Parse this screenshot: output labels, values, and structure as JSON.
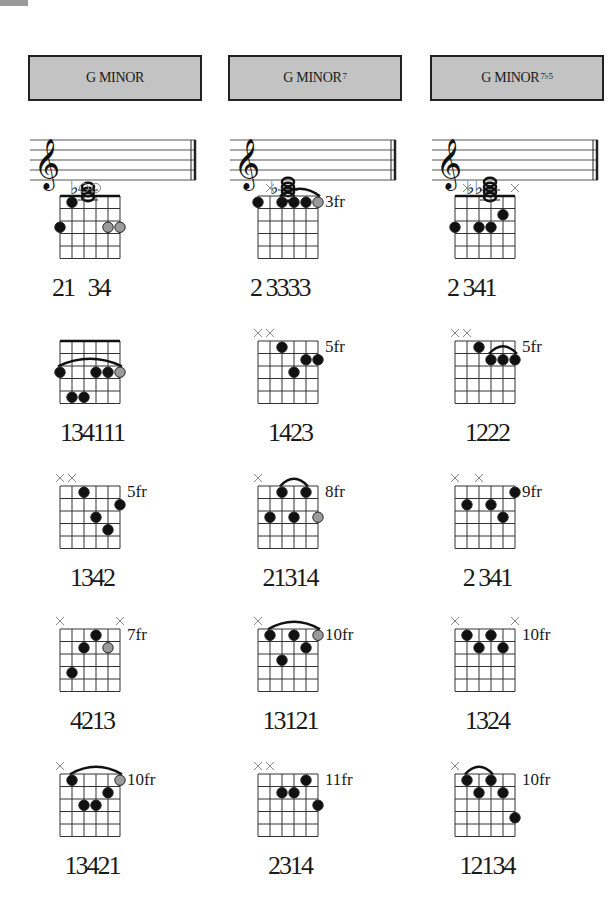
{
  "page": {
    "corner_tab_color": "#9a9a9a",
    "header_bg": "#c3c3c3"
  },
  "columns": [
    {
      "title": "G MINOR",
      "superscript": "",
      "staff": {
        "accidentals": "♭",
        "notes": 3
      },
      "diagrams": [
        {
          "markers": [
            "",
            "",
            "o",
            "o",
            "",
            ""
          ],
          "fret_label": "",
          "nut": true,
          "barre": null,
          "dots": [
            {
              "s": 0,
              "f": 3,
              "c": "b"
            },
            {
              "s": 1,
              "f": 1,
              "c": "b"
            },
            {
              "s": 4,
              "f": 3,
              "c": "g"
            },
            {
              "s": 5,
              "f": 3,
              "c": "g"
            }
          ],
          "fingering": "21   34"
        },
        {
          "markers": [
            "",
            "",
            "",
            "",
            "",
            ""
          ],
          "fret_label": "",
          "nut": true,
          "barre": {
            "from": 0,
            "to": 5,
            "f": 3
          },
          "dots": [
            {
              "s": 0,
              "f": 3,
              "c": "b"
            },
            {
              "s": 1,
              "f": 5,
              "c": "b"
            },
            {
              "s": 2,
              "f": 5,
              "c": "b"
            },
            {
              "s": 3,
              "f": 3,
              "c": "b"
            },
            {
              "s": 4,
              "f": 3,
              "c": "b"
            },
            {
              "s": 5,
              "f": 3,
              "c": "g"
            }
          ],
          "fingering": "134111"
        },
        {
          "markers": [
            "x",
            "x",
            "",
            "",
            "",
            ""
          ],
          "fret_label": "5fr",
          "nut": false,
          "barre": null,
          "dots": [
            {
              "s": 2,
              "f": 1,
              "c": "b"
            },
            {
              "s": 3,
              "f": 3,
              "c": "b"
            },
            {
              "s": 4,
              "f": 4,
              "c": "b"
            },
            {
              "s": 5,
              "f": 2,
              "c": "b"
            }
          ],
          "fingering": "1342"
        },
        {
          "markers": [
            "x",
            "",
            "",
            "",
            "",
            "x"
          ],
          "fret_label": "7fr",
          "nut": false,
          "barre": null,
          "dots": [
            {
              "s": 1,
              "f": 4,
              "c": "b"
            },
            {
              "s": 2,
              "f": 2,
              "c": "b"
            },
            {
              "s": 3,
              "f": 1,
              "c": "b"
            },
            {
              "s": 4,
              "f": 2,
              "c": "g"
            }
          ],
          "fingering": "4213"
        },
        {
          "markers": [
            "x",
            "",
            "",
            "",
            "",
            ""
          ],
          "fret_label": "10fr",
          "nut": false,
          "barre": {
            "from": 1,
            "to": 5,
            "f": 1
          },
          "dots": [
            {
              "s": 1,
              "f": 1,
              "c": "b"
            },
            {
              "s": 2,
              "f": 3,
              "c": "b"
            },
            {
              "s": 3,
              "f": 3,
              "c": "b"
            },
            {
              "s": 4,
              "f": 2,
              "c": "b"
            },
            {
              "s": 5,
              "f": 1,
              "c": "g"
            }
          ],
          "fingering": "13421"
        }
      ]
    },
    {
      "title": "G MINOR",
      "superscript": "7",
      "staff": {
        "accidentals": "♭",
        "notes": 4
      },
      "diagrams": [
        {
          "markers": [
            "",
            "x",
            "",
            "",
            "",
            ""
          ],
          "fret_label": "3fr",
          "nut": false,
          "barre": {
            "from": 2,
            "to": 5,
            "f": 1
          },
          "dots": [
            {
              "s": 0,
              "f": 1,
              "c": "b"
            },
            {
              "s": 2,
              "f": 1,
              "c": "b"
            },
            {
              "s": 3,
              "f": 1,
              "c": "b"
            },
            {
              "s": 4,
              "f": 1,
              "c": "b"
            },
            {
              "s": 5,
              "f": 1,
              "c": "g"
            }
          ],
          "fingering": "2 3333"
        },
        {
          "markers": [
            "x",
            "x",
            "",
            "",
            "",
            ""
          ],
          "fret_label": "5fr",
          "nut": false,
          "barre": null,
          "dots": [
            {
              "s": 2,
              "f": 1,
              "c": "b"
            },
            {
              "s": 3,
              "f": 3,
              "c": "b"
            },
            {
              "s": 4,
              "f": 2,
              "c": "b"
            },
            {
              "s": 5,
              "f": 2,
              "c": "b"
            }
          ],
          "fingering": "1423"
        },
        {
          "markers": [
            "x",
            "",
            "",
            "",
            "",
            ""
          ],
          "fret_label": "8fr",
          "nut": false,
          "barre": {
            "from": 2,
            "to": 4,
            "f": 1
          },
          "dots": [
            {
              "s": 1,
              "f": 3,
              "c": "b"
            },
            {
              "s": 2,
              "f": 1,
              "c": "b"
            },
            {
              "s": 3,
              "f": 3,
              "c": "b"
            },
            {
              "s": 4,
              "f": 1,
              "c": "b"
            },
            {
              "s": 5,
              "f": 3,
              "c": "g"
            }
          ],
          "fingering": "21314"
        },
        {
          "markers": [
            "x",
            "",
            "",
            "",
            "",
            ""
          ],
          "fret_label": "10fr",
          "nut": false,
          "barre": {
            "from": 1,
            "to": 5,
            "f": 1
          },
          "dots": [
            {
              "s": 1,
              "f": 1,
              "c": "b"
            },
            {
              "s": 2,
              "f": 3,
              "c": "b"
            },
            {
              "s": 3,
              "f": 1,
              "c": "b"
            },
            {
              "s": 4,
              "f": 2,
              "c": "b"
            },
            {
              "s": 5,
              "f": 1,
              "c": "g"
            }
          ],
          "fingering": "13121"
        },
        {
          "markers": [
            "x",
            "x",
            "",
            "",
            "",
            ""
          ],
          "fret_label": "11fr",
          "nut": false,
          "barre": null,
          "dots": [
            {
              "s": 2,
              "f": 2,
              "c": "b"
            },
            {
              "s": 3,
              "f": 2,
              "c": "b"
            },
            {
              "s": 4,
              "f": 1,
              "c": "b"
            },
            {
              "s": 5,
              "f": 3,
              "c": "b"
            }
          ],
          "fingering": "2314"
        }
      ]
    },
    {
      "title": "G MINOR",
      "superscript": "7♭5",
      "staff": {
        "accidentals": "♭♭",
        "notes": 4
      },
      "diagrams": [
        {
          "markers": [
            "",
            "x",
            "",
            "",
            "",
            "x"
          ],
          "fret_label": "",
          "nut": true,
          "barre": null,
          "dots": [
            {
              "s": 0,
              "f": 3,
              "c": "b"
            },
            {
              "s": 2,
              "f": 3,
              "c": "b"
            },
            {
              "s": 3,
              "f": 3,
              "c": "b"
            },
            {
              "s": 4,
              "f": 2,
              "c": "b"
            }
          ],
          "fingering": "2 341"
        },
        {
          "markers": [
            "x",
            "x",
            "",
            "",
            "",
            ""
          ],
          "fret_label": "5fr",
          "nut": false,
          "barre": {
            "from": 3,
            "to": 5,
            "f": 2
          },
          "dots": [
            {
              "s": 2,
              "f": 1,
              "c": "b"
            },
            {
              "s": 3,
              "f": 2,
              "c": "b"
            },
            {
              "s": 4,
              "f": 2,
              "c": "b"
            },
            {
              "s": 5,
              "f": 2,
              "c": "b"
            }
          ],
          "fingering": "1222"
        },
        {
          "markers": [
            "x",
            "",
            "x",
            "",
            "",
            ""
          ],
          "fret_label": "9fr",
          "nut": false,
          "barre": null,
          "dots": [
            {
              "s": 1,
              "f": 2,
              "c": "b"
            },
            {
              "s": 3,
              "f": 2,
              "c": "b"
            },
            {
              "s": 4,
              "f": 3,
              "c": "b"
            },
            {
              "s": 5,
              "f": 1,
              "c": "b"
            }
          ],
          "fingering": "2 341"
        },
        {
          "markers": [
            "x",
            "",
            "",
            "",
            "",
            "x"
          ],
          "fret_label": "10fr",
          "nut": false,
          "barre": null,
          "dots": [
            {
              "s": 1,
              "f": 1,
              "c": "b"
            },
            {
              "s": 2,
              "f": 2,
              "c": "b"
            },
            {
              "s": 3,
              "f": 1,
              "c": "b"
            },
            {
              "s": 4,
              "f": 2,
              "c": "b"
            }
          ],
          "fingering": "1324"
        },
        {
          "markers": [
            "x",
            "",
            "",
            "",
            "",
            ""
          ],
          "fret_label": "10fr",
          "nut": false,
          "barre": {
            "from": 1,
            "to": 3,
            "f": 1
          },
          "dots": [
            {
              "s": 1,
              "f": 1,
              "c": "b"
            },
            {
              "s": 2,
              "f": 2,
              "c": "b"
            },
            {
              "s": 3,
              "f": 1,
              "c": "b"
            },
            {
              "s": 4,
              "f": 2,
              "c": "b"
            },
            {
              "s": 5,
              "f": 4,
              "c": "b"
            }
          ],
          "fingering": "12134"
        }
      ]
    }
  ]
}
